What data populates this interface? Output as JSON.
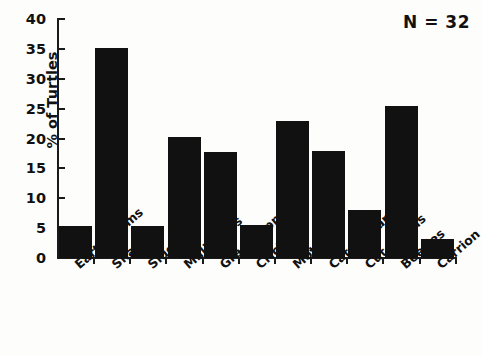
{
  "chart_data": {
    "type": "bar",
    "title": "",
    "xlabel": "",
    "ylabel": "% of Turtles",
    "ylim": [
      0,
      40
    ],
    "ytick_values": [
      0,
      5,
      10,
      15,
      20,
      25,
      30,
      35,
      40
    ],
    "ytick_labels": [
      "0",
      "5",
      "10",
      "15",
      "20",
      "25",
      "30",
      "35",
      "40"
    ],
    "grid": false,
    "legend": "none",
    "bar_color": "#111111",
    "categories": [
      "Earthworms",
      "Snails",
      "Slugs",
      "Millipedes",
      "Grasshoppers",
      "Crickets",
      "Moths",
      "Caterpillars",
      "Cut worms",
      "Beetles",
      "Carrion"
    ],
    "values": [
      5.3,
      35.2,
      5.3,
      20.3,
      17.7,
      5.5,
      22.9,
      17.9,
      8.0,
      25.5,
      3.2
    ],
    "annotations": [
      {
        "text": "N = 32",
        "position": "top-right"
      }
    ]
  },
  "annotation": {
    "sample_size_label": "N = 32"
  },
  "axis": {
    "y_title": "% of Turtles"
  }
}
